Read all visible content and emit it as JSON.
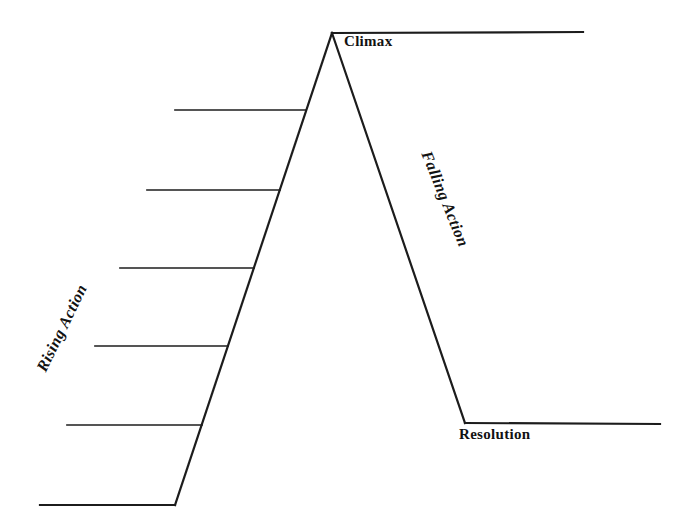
{
  "diagram": {
    "type": "story-plot-structure",
    "labels": {
      "climax": "Climax",
      "rising_action": "Rising Action",
      "falling_action": "Falling Action",
      "resolution": "Resolution"
    },
    "rising_action_blank_event_lines": 5,
    "colors": {
      "line": "#1c1c1c",
      "text": "#121212",
      "background": "#ffffff"
    }
  }
}
